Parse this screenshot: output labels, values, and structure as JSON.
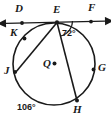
{
  "figure": {
    "type": "circle-geometry-diagram",
    "stroke_color": "#1a1a1a",
    "background": "#ffffff",
    "width": 111,
    "height": 120
  },
  "circle": {
    "center_label": "Q",
    "center_x": 54,
    "center_y": 64,
    "radius": 41
  },
  "tangent_line": {
    "name": "DF",
    "left_endpoint_label": "D",
    "right_endpoint_label": "F",
    "tangent_point_label": "E",
    "double_arrow": true
  },
  "points": [
    {
      "label": "D",
      "x": 22,
      "y": 20,
      "on_circle": false
    },
    {
      "label": "E",
      "x": 57,
      "y": 22,
      "on_circle": true
    },
    {
      "label": "F",
      "x": 91,
      "y": 20,
      "on_circle": false
    },
    {
      "label": "K",
      "x": 22,
      "y": 34,
      "on_circle": true
    },
    {
      "label": "J",
      "x": 14,
      "y": 71,
      "on_circle": true
    },
    {
      "label": "G",
      "x": 93,
      "y": 68,
      "on_circle": true
    },
    {
      "label": "H",
      "x": 76,
      "y": 100,
      "on_circle": true
    },
    {
      "label": "Q",
      "x": 54,
      "y": 64,
      "on_circle": false
    }
  ],
  "chords": [
    {
      "from": "E",
      "to": "J"
    },
    {
      "from": "E",
      "to": "H"
    }
  ],
  "angles": [
    {
      "value": "72°",
      "at": "E",
      "between": "tangent EF and chord EH"
    }
  ],
  "arcs": [
    {
      "value": "106°",
      "arc": "JH",
      "position": "below-left outside circle"
    }
  ],
  "labels": {
    "D": "D",
    "E": "E",
    "F": "F",
    "K": "K",
    "J": "J",
    "G": "G",
    "H": "H",
    "Q": "Q",
    "angle_72": "72°",
    "arc_106": "106°"
  }
}
